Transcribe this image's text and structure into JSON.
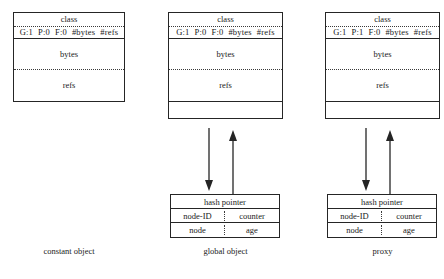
{
  "figure": {
    "background_color": "#ffffff",
    "line_color": "#252525"
  },
  "objects": [
    {
      "id": "constant-object",
      "caption": "constant object",
      "header": "class",
      "flags": {
        "generation": "G:1",
        "pointer": "P:0",
        "forward": "F:0",
        "bytes_count": "#bytes",
        "refs_count": "#refs"
      },
      "sections": {
        "bytes": "bytes",
        "refs": "refs"
      },
      "has_trailer_row": false,
      "has_hash_table": false
    },
    {
      "id": "global-object",
      "caption": "global object",
      "header": "class",
      "flags": {
        "generation": "G:1",
        "pointer": "P:0",
        "forward": "F:0",
        "bytes_count": "#bytes",
        "refs_count": "#refs"
      },
      "sections": {
        "bytes": "bytes",
        "refs": "refs"
      },
      "has_trailer_row": true,
      "has_hash_table": true,
      "hash_table": {
        "title": "hash pointer",
        "rows": [
          [
            "node-ID",
            "counter"
          ],
          [
            "node",
            "age"
          ]
        ]
      }
    },
    {
      "id": "proxy",
      "caption": "proxy",
      "header": "class",
      "flags": {
        "generation": "G:1",
        "pointer": "P:1",
        "forward": "F:0",
        "bytes_count": "#bytes",
        "refs_count": "#refs"
      },
      "sections": {
        "bytes": "bytes",
        "refs": "refs"
      },
      "has_trailer_row": true,
      "has_hash_table": true,
      "hash_table": {
        "title": "hash pointer",
        "rows": [
          [
            "node-ID",
            "counter"
          ],
          [
            "node",
            "age"
          ]
        ]
      }
    }
  ]
}
